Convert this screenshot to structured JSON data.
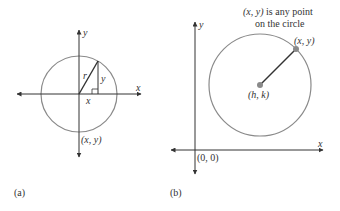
{
  "figure_a": {
    "label": "(a)",
    "axis_x_label": "x",
    "axis_y_label": "y",
    "radius_label": "r",
    "leg_y_label": "y",
    "leg_x_label": "x",
    "point_label": "(x, y)"
  },
  "figure_b": {
    "label": "(b)",
    "axis_x_label": "x",
    "axis_y_label": "y",
    "annotation_line1": "(x, y) is any point",
    "annotation_line2": "on the circle",
    "point_label": "(x, y)",
    "center_label": "(h, k)",
    "origin_label": "(0, 0)"
  },
  "colors": {
    "axis": "#333333",
    "circle": "#8a8a8a",
    "point": "#8a8a8a",
    "triangle": "#333333"
  }
}
